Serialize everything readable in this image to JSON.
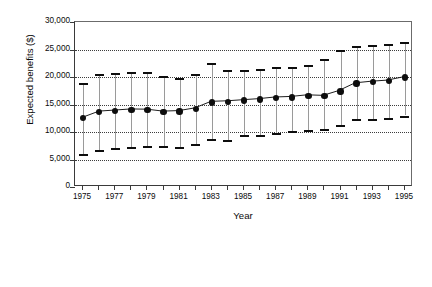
{
  "chart_data": {
    "type": "line",
    "title": "",
    "xlabel": "Year",
    "ylabel": "Expected benefits ($)",
    "xlim": [
      1974.5,
      1995.5
    ],
    "ylim": [
      0,
      30000
    ],
    "ytick_values": [
      0,
      5000,
      10000,
      15000,
      20000,
      25000,
      30000
    ],
    "ytick_labels": [
      "0",
      "5,000",
      "10,000",
      "15,000",
      "20,000",
      "25,000",
      "30,000"
    ],
    "xtick_values": [
      1975,
      1976,
      1977,
      1978,
      1979,
      1980,
      1981,
      1982,
      1983,
      1984,
      1985,
      1986,
      1987,
      1988,
      1989,
      1990,
      1991,
      1992,
      1993,
      1994,
      1995
    ],
    "xtick_labels_shown": [
      "1975",
      "1977",
      "1979",
      "1981",
      "1983",
      "1985",
      "1987",
      "1989",
      "1991",
      "1993",
      "1995"
    ],
    "grid": "horizontal-dotted",
    "legend": "none",
    "marker": "filled-circle",
    "error_bar_style": "capped-vertical",
    "series": [
      {
        "name": "Expected benefits",
        "x": [
          1975,
          1976,
          1977,
          1978,
          1979,
          1980,
          1981,
          1982,
          1983,
          1984,
          1985,
          1986,
          1987,
          1988,
          1989,
          1990,
          1991,
          1992,
          1993,
          1994,
          1995
        ],
        "values": [
          12500,
          13600,
          13800,
          14000,
          13950,
          13600,
          13700,
          14200,
          15400,
          15500,
          15700,
          15900,
          16200,
          16300,
          16600,
          16500,
          17400,
          18800,
          19100,
          19300,
          19900
        ],
        "upper": [
          19000,
          20500,
          20800,
          21000,
          20900,
          20100,
          19900,
          20600,
          22500,
          21200,
          21300,
          21500,
          21800,
          21900,
          22100,
          23300,
          25000,
          25700,
          25800,
          26000,
          26400
        ],
        "lower": [
          6000,
          6800,
          7100,
          7300,
          7400,
          7400,
          7200,
          7800,
          8700,
          8500,
          9400,
          9500,
          9900,
          10200,
          10300,
          10500,
          11200,
          12300,
          12400,
          12600,
          13000
        ]
      }
    ],
    "colors": {
      "marker": "#0d0d0d",
      "line": "#1a1a1a",
      "error_bar": "#9a9a9a",
      "error_cap": "#0d0d0d",
      "grid": "#3d3d3d",
      "axis": "#3a3a3a",
      "background": "#ffffff"
    }
  }
}
